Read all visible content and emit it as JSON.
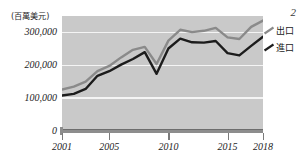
{
  "figure": {
    "unit_label": "(百萬美元)",
    "page_marker": "2"
  },
  "legend": {
    "position": "right",
    "items": [
      {
        "label": "出口",
        "color": "#8a8a8a",
        "icon": "line-swatch-icon"
      },
      {
        "label": "進口",
        "color": "#1c1c1c",
        "icon": "line-swatch-icon"
      }
    ]
  },
  "axes": {
    "y_ticks": [
      "300,000",
      "200,000",
      "100,000",
      "0"
    ],
    "x_ticks": [
      "2001",
      "2005",
      "2010",
      "2015",
      "2018"
    ]
  },
  "chart_data": {
    "type": "line",
    "title": "",
    "subtitle": "",
    "xlabel": "",
    "ylabel": "(百萬美元)",
    "ylim": [
      0,
      350000
    ],
    "xlim": [
      2001,
      2018
    ],
    "grid": true,
    "legend_position": "right",
    "x": [
      2001,
      2002,
      2003,
      2004,
      2005,
      2006,
      2007,
      2008,
      2009,
      2010,
      2011,
      2012,
      2013,
      2014,
      2015,
      2016,
      2017,
      2018
    ],
    "categories": [
      "2001",
      "2002",
      "2003",
      "2004",
      "2005",
      "2006",
      "2007",
      "2008",
      "2009",
      "2010",
      "2011",
      "2012",
      "2013",
      "2014",
      "2015",
      "2016",
      "2017",
      "2018"
    ],
    "series": [
      {
        "name": "出口",
        "color": "#8a8a8a",
        "values": [
          126000,
          135000,
          150000,
          182000,
          198000,
          224000,
          247000,
          256000,
          204000,
          275000,
          308000,
          301000,
          305000,
          314000,
          285000,
          280000,
          317000,
          336000
        ]
      },
      {
        "name": "進口",
        "color": "#1c1c1c",
        "values": [
          108000,
          113000,
          128000,
          168000,
          182000,
          202000,
          219000,
          240000,
          174000,
          251000,
          281000,
          270000,
          269000,
          274000,
          237000,
          230000,
          259000,
          287000
        ]
      }
    ]
  }
}
